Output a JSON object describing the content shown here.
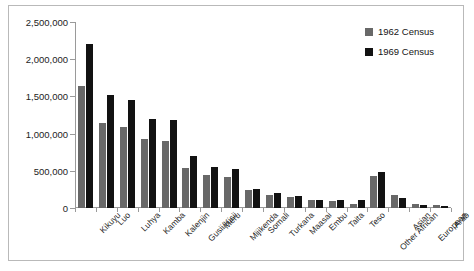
{
  "chart_data": {
    "type": "bar",
    "title": "",
    "xlabel": "",
    "ylabel": "",
    "ylim": [
      0,
      2500000
    ],
    "ytick_labels": [
      "2,500,000",
      "2,000,000",
      "1,500,000",
      "1,000,000",
      "500,000",
      "0"
    ],
    "ytick_values": [
      2500000,
      2000000,
      1500000,
      1000000,
      500000,
      0
    ],
    "grid": false,
    "legend_position": "top-right",
    "categories": [
      "Kikuyu",
      "Luo",
      "Luhya",
      "Kamba",
      "Kalenjin",
      "Gusii/Kisii",
      "Meru",
      "Mijikenda",
      "Somali",
      "Turkana",
      "Maasai",
      "Embu",
      "Taita",
      "Teso",
      "Other African",
      "Asian",
      "European",
      "Arab"
    ],
    "series": [
      {
        "name": "1962 Census",
        "color": "#686868",
        "values": [
          1643000,
          1148000,
          1086000,
          933000,
          900000,
          538000,
          440000,
          414000,
          240000,
          180000,
          154000,
          110000,
          95000,
          60000,
          430000,
          177000,
          56000,
          38000
        ]
      },
      {
        "name": "1969 Census",
        "color": "#121212",
        "values": [
          2202000,
          1521000,
          1453000,
          1198000,
          1187000,
          702000,
          554000,
          520000,
          250000,
          203000,
          155000,
          112000,
          106000,
          105000,
          490000,
          139000,
          41000,
          28000
        ]
      }
    ]
  },
  "legend": {
    "entries": [
      {
        "label": "1962 Census"
      },
      {
        "label": "1969 Census"
      }
    ]
  }
}
